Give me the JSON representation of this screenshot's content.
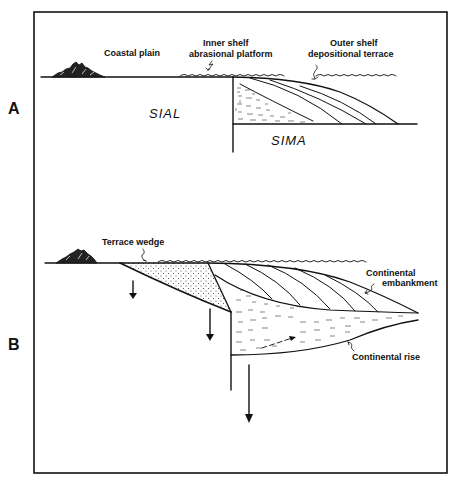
{
  "figure": {
    "type": "geologic cross-section",
    "frame_color": "#111111",
    "background": "#ffffff"
  },
  "panels": [
    {
      "id": "A",
      "label": "A",
      "annotations": {
        "coastal_plain": "Coastal plain",
        "inner_shelf_line1": "Inner shelf",
        "inner_shelf_line2": "abrasional platform",
        "outer_shelf_line1": "Outer shelf",
        "outer_shelf_line2": "depositional terrace",
        "sial": "SIAL",
        "sima": "SIMA"
      }
    },
    {
      "id": "B",
      "label": "B",
      "annotations": {
        "terrace_wedge": "Terrace wedge",
        "embankment_line1": "Continental",
        "embankment_line2": "embankment",
        "continental_rise": "Continental rise"
      }
    }
  ]
}
